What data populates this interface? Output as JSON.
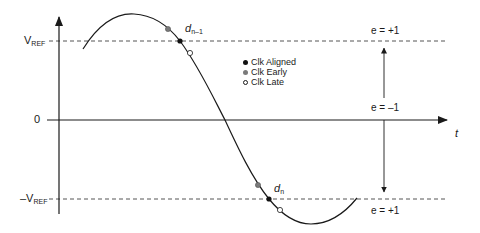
{
  "diagram": {
    "axes": {
      "y_labels": {
        "vref": {
          "main": "V",
          "sub": "REF"
        },
        "zero": "0",
        "neg_vref": {
          "prefix": "–V",
          "sub": "REF"
        }
      },
      "x_label": "t"
    },
    "points": {
      "d_prev": {
        "main": "d",
        "sub": "n–1"
      },
      "d_curr": {
        "main": "d",
        "sub": "n"
      }
    },
    "error_labels": {
      "top": "e = +1",
      "middle": "e = –1",
      "bottom": "e = +1"
    },
    "legend": [
      {
        "label": "Clk Aligned",
        "marker": "filled-black",
        "color": "#111111"
      },
      {
        "label": "Clk Early",
        "marker": "filled-gray",
        "color": "#7a7a7a"
      },
      {
        "label": "Clk Late",
        "marker": "hollow",
        "color": "#ffffff"
      }
    ],
    "colors": {
      "line": "#1a1a1a",
      "dashed": "#555555",
      "early": "#7a7a7a",
      "aligned": "#111111",
      "late": "#ffffff"
    }
  }
}
